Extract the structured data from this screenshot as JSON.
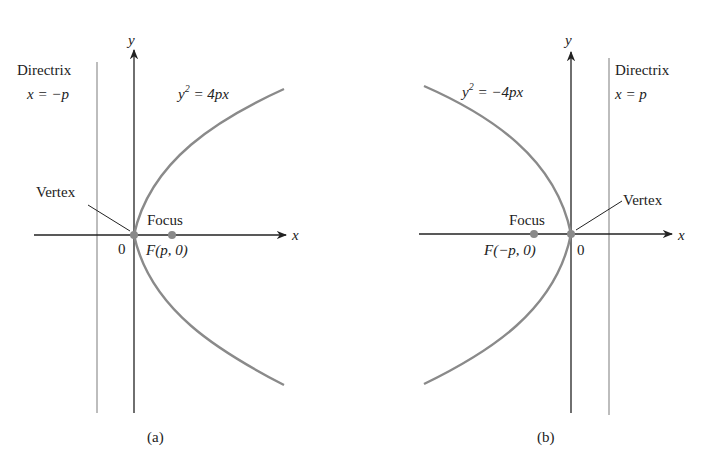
{
  "panels": [
    {
      "caption": "(a)",
      "equation": {
        "base": "y",
        "exp": "2",
        "rest": " = 4px"
      },
      "directrix": {
        "title": "Directrix",
        "eq": "x = −p"
      },
      "vertex_label": "Vertex",
      "focus_label": "Focus",
      "focus_coord": "F(p, 0)",
      "origin_label": "0",
      "x_axis_label": "x",
      "y_axis_label": "y"
    },
    {
      "caption": "(b)",
      "equation": {
        "base": "y",
        "exp": "2",
        "rest": " = −4px"
      },
      "directrix": {
        "title": "Directrix",
        "eq": "x = p"
      },
      "vertex_label": "Vertex",
      "focus_label": "Focus",
      "focus_coord": "F(−p, 0)",
      "origin_label": "0",
      "x_axis_label": "x",
      "y_axis_label": "y"
    }
  ],
  "colors": {
    "curve": "#8a8a8a",
    "axis": "#222222",
    "directrix": "#9a9a9a",
    "point": "#8a8a8a"
  }
}
